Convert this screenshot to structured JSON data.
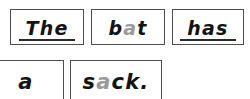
{
  "sheet": {
    "kind": "word-card-sentence-strip",
    "sentence": "The bat has a sack.",
    "ink_color": "#141414",
    "highlight_color": "#9a9a9a",
    "card_border_color": "#4e4e4e",
    "background_color": "#ffffff"
  },
  "rows": [
    {
      "cards": [
        {
          "word": "The",
          "prefix": "Th",
          "highlight": "",
          "suffix": "e",
          "underlined": true
        },
        {
          "word": "bat",
          "prefix": "b",
          "highlight": "a",
          "suffix": "t",
          "underlined": false
        },
        {
          "word": "has",
          "prefix": "ha",
          "highlight": "",
          "suffix": "s",
          "underlined": true
        }
      ]
    },
    {
      "cards": [
        {
          "word": "a",
          "prefix": "a",
          "highlight": "",
          "suffix": "",
          "underlined": false
        },
        {
          "word": "sack.",
          "prefix": "s",
          "highlight": "a",
          "suffix": "ck.",
          "underlined": false
        }
      ]
    }
  ]
}
